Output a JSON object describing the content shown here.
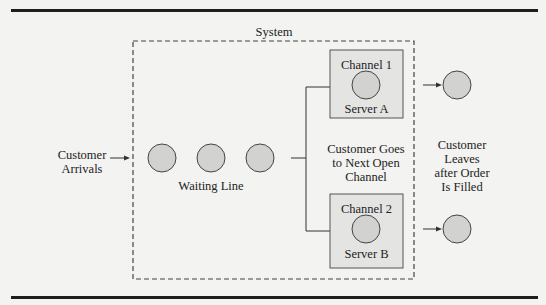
{
  "diagram": {
    "system_label": "System",
    "arrivals": {
      "line1": "Customer",
      "line2": "Arrivals"
    },
    "waiting_line_label": "Waiting Line",
    "waiting_customers": 3,
    "channels": [
      {
        "title": "Channel 1",
        "server": "Server A"
      },
      {
        "title": "Channel 2",
        "server": "Server B"
      }
    ],
    "routing_label": {
      "line1": "Customer Goes",
      "line2": "to Next Open",
      "line3": "Channel"
    },
    "departure_label": {
      "line1": "Customer",
      "line2": "Leaves",
      "line3": "after Order",
      "line4": "Is Filled"
    },
    "colors": {
      "circle_fill": "#d2d2d0",
      "box_fill": "#e4e4e2",
      "stroke": "#333333",
      "background": "#f3f3f1"
    }
  }
}
